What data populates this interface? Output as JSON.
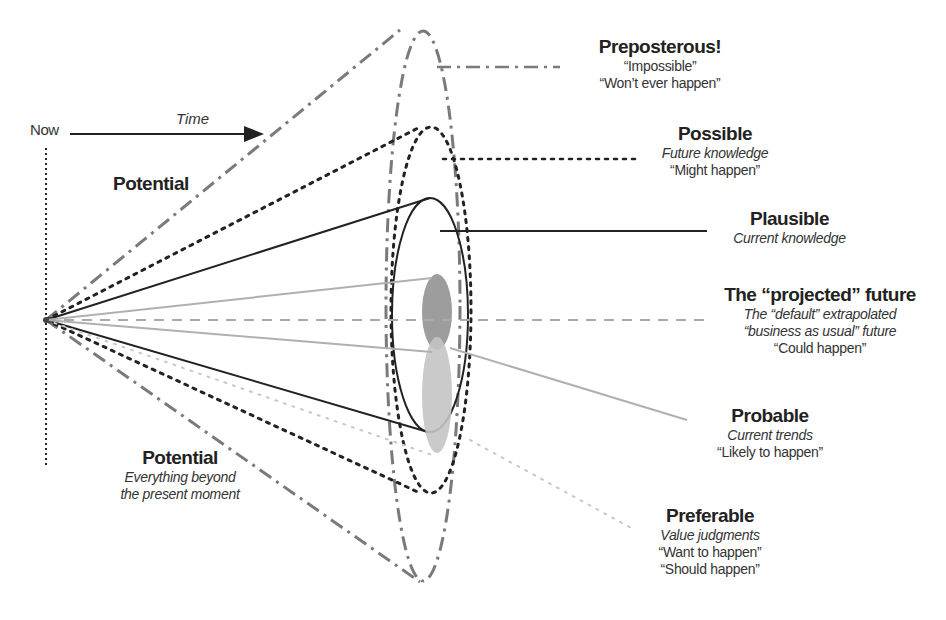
{
  "diagram": {
    "type": "futures-cone",
    "axis": {
      "origin_label": "Now",
      "arrow_label": "Time"
    },
    "left_labels": {
      "upper": {
        "title": "Potential"
      },
      "lower": {
        "title": "Potential",
        "lines": [
          "Everything beyond",
          "the present moment"
        ]
      }
    },
    "cones": [
      {
        "id": "preposterous",
        "title": "Preposterous!",
        "lines": [
          "“Impossible”",
          "“Won’t ever happen”"
        ],
        "line_style": "dash-dot",
        "color": "#7a7a7a"
      },
      {
        "id": "possible",
        "title": "Possible",
        "lines_italic": [
          "Future knowledge"
        ],
        "lines": [
          "“Might happen”"
        ],
        "line_style": "dotted",
        "color": "#222222"
      },
      {
        "id": "plausible",
        "title": "Plausible",
        "lines_italic": [
          "Current knowledge"
        ],
        "lines": [],
        "line_style": "solid",
        "color": "#222222"
      },
      {
        "id": "projected",
        "title": "The “projected” future",
        "lines_italic": [
          "The “default” extrapolated",
          "“business as usual” future"
        ],
        "lines": [
          "“Could happen”"
        ],
        "line_style": "dashed",
        "color": "#aaaaaa"
      },
      {
        "id": "probable",
        "title": "Probable",
        "lines_italic": [
          "Current trends"
        ],
        "lines": [
          "“Likely to happen”"
        ],
        "line_style": "solid-light",
        "color": "#b0b0b0"
      },
      {
        "id": "preferable",
        "title": "Preferable",
        "lines_italic": [
          "Value judgments"
        ],
        "lines": [
          "“Want to happen”",
          "“Should happen”"
        ],
        "line_style": "dotted-light",
        "color": "#c8c8c8"
      }
    ],
    "colors": {
      "dark": "#222222",
      "mid_gray": "#7a7a7a",
      "light_gray": "#b0b0b0",
      "probable_blob": "#8c8c8c",
      "preferable_blob": "#c4c4c4"
    }
  }
}
